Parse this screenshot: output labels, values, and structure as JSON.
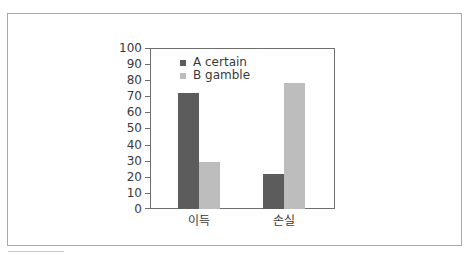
{
  "colors": {
    "series_a": "#5c5c5c",
    "series_b": "#bdbdbd",
    "axis": "#6e6e6e",
    "frame": "#a9a9a9"
  },
  "chart": {
    "legend": [
      {
        "label": "A certain",
        "color": "#5c5c5c"
      },
      {
        "label": "B gamble",
        "color": "#bdbdbd"
      }
    ],
    "y_ticks": [
      "100",
      "90",
      "80",
      "70",
      "60",
      "50",
      "40",
      "30",
      "20",
      "10",
      "0"
    ],
    "x_labels": [
      "이득",
      "손실"
    ]
  },
  "chart_data": {
    "type": "bar",
    "title": "",
    "xlabel": "",
    "ylabel": "",
    "categories": [
      "이득",
      "손실"
    ],
    "series": [
      {
        "name": "A certain",
        "values": [
          72,
          22
        ]
      },
      {
        "name": "B gamble",
        "values": [
          29,
          78
        ]
      }
    ],
    "ylim": [
      0,
      100
    ],
    "y_ticks": [
      0,
      10,
      20,
      30,
      40,
      50,
      60,
      70,
      80,
      90,
      100
    ],
    "grid": false,
    "legend_position": "upper left (inside plot)"
  }
}
